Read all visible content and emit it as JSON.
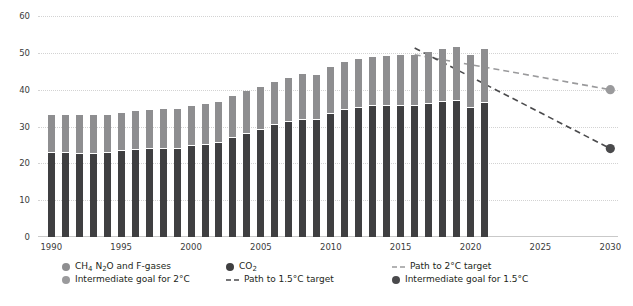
{
  "chart_data": {
    "type": "bar",
    "title": "",
    "subtitle": "",
    "xlabel": "",
    "ylabel": "",
    "ylim": [
      0,
      60
    ],
    "yticks": [
      0,
      10,
      20,
      30,
      40,
      50,
      60
    ],
    "ytick_labels": [
      "0",
      "10",
      "20",
      "30",
      "40",
      "50",
      "60"
    ],
    "xlim": [
      1989.3,
      2030.8
    ],
    "xticks": [
      1990,
      1995,
      2000,
      2005,
      2010,
      2015,
      2020,
      2025,
      2030
    ],
    "xtick_labels": [
      "1990",
      "1995",
      "2000",
      "2005",
      "2010",
      "2015",
      "2020",
      "2025",
      "2030"
    ],
    "grid": "horizontal-dotted",
    "legend_position": "bottom",
    "stacked": true,
    "categories": [
      1990,
      1991,
      1992,
      1993,
      1994,
      1995,
      1996,
      1997,
      1998,
      1999,
      2000,
      2001,
      2002,
      2003,
      2004,
      2005,
      2006,
      2007,
      2008,
      2009,
      2010,
      2011,
      2012,
      2013,
      2014,
      2015,
      2016,
      2017,
      2018,
      2019,
      2020,
      2021
    ],
    "series": [
      {
        "name": "CO2",
        "color": "#3f3f41",
        "values": [
          22.8,
          22.7,
          22.6,
          22.6,
          22.7,
          23.3,
          23.7,
          23.9,
          23.9,
          23.9,
          24.6,
          25.0,
          25.5,
          26.8,
          28.0,
          29.1,
          30.3,
          31.3,
          31.9,
          31.7,
          33.5,
          34.6,
          35.0,
          35.5,
          35.6,
          35.5,
          35.5,
          36.0,
          36.6,
          36.9,
          34.9,
          36.3
        ]
      },
      {
        "name": "CH4 N2O and F-gases",
        "color": "#8e8e90",
        "values": [
          10.2,
          10.3,
          10.4,
          10.4,
          10.5,
          10.5,
          10.6,
          10.7,
          10.8,
          10.9,
          10.9,
          11.0,
          11.2,
          11.4,
          11.6,
          11.7,
          11.9,
          12.0,
          12.3,
          12.4,
          12.6,
          12.9,
          13.2,
          13.4,
          13.6,
          13.8,
          14.0,
          14.2,
          14.5,
          14.7,
          14.6,
          14.7
        ]
      }
    ],
    "totals": [
      33.0,
      33.0,
      33.0,
      33.0,
      33.2,
      33.8,
      34.3,
      34.6,
      34.7,
      34.8,
      35.5,
      36.0,
      36.7,
      38.2,
      39.6,
      40.8,
      42.2,
      43.3,
      44.2,
      44.1,
      46.1,
      47.5,
      48.2,
      48.9,
      49.2,
      49.3,
      49.5,
      50.2,
      51.1,
      51.6,
      49.5,
      51.0
    ],
    "lines": [
      {
        "name": "Path to 2°C target",
        "color": "#9a9a9c",
        "style": "dashed",
        "points": [
          [
            2016,
            49.5
          ],
          [
            2030,
            40.0
          ]
        ]
      },
      {
        "name": "Path to 1.5°C target",
        "color": "#4a4a4c",
        "style": "dashed",
        "points": [
          [
            2016,
            51.3
          ],
          [
            2030,
            24.0
          ]
        ]
      }
    ],
    "markers": [
      {
        "name": "Intermediate goal for 2°C",
        "color": "#9a9a9c",
        "x": 2030,
        "y": 40.0
      },
      {
        "name": "Intermediate goal for 1.5°C",
        "color": "#4a4a4c",
        "x": 2030,
        "y": 24.0
      }
    ]
  },
  "legend": {
    "items": [
      {
        "id": "ch4-n2o-fgases",
        "label": "CH4 N2O and F-gases",
        "marker": "dot",
        "color": "#8e8e90",
        "col": 0,
        "row": 0
      },
      {
        "id": "intermediate-goal-2c",
        "label": "Intermediate goal for 2°C",
        "marker": "dot",
        "color": "#9a9a9c",
        "col": 0,
        "row": 1
      },
      {
        "id": "co2",
        "label": "CO2",
        "marker": "dot",
        "color": "#3f3f41",
        "col": 1,
        "row": 0
      },
      {
        "id": "path-to-1-5c",
        "label": "Path to 1.5°C target",
        "marker": "dash",
        "color": "#4a4a4c",
        "col": 1,
        "row": 1
      },
      {
        "id": "path-to-2c",
        "label": "Path to 2°C target",
        "marker": "dash",
        "color": "#9a9a9c",
        "col": 2,
        "row": 0
      },
      {
        "id": "intermediate-goal-1-5c",
        "label": "Intermediate goal for 1.5°C",
        "marker": "dot",
        "color": "#4a4a4c",
        "col": 2,
        "row": 1
      }
    ]
  },
  "colors": {
    "co2": "#3f3f41",
    "other_gases": "#8e8e90",
    "path_2c": "#9a9a9c",
    "path_15c": "#4a4a4c",
    "grid": "#d3d3d3",
    "text": "#231f20",
    "background": "#ffffff"
  }
}
